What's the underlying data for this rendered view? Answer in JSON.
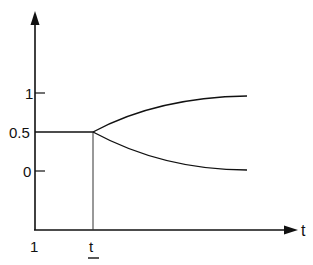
{
  "diagram": {
    "type": "line",
    "x_axis": {
      "label": "t",
      "tick_labels": [
        "1",
        "t"
      ],
      "marked_tick": "t"
    },
    "y_axis": {
      "tick_labels": [
        "1",
        "0.5",
        "0"
      ]
    },
    "series": [
      {
        "name": "constant-segment",
        "description": "horizontal at 0.5 from 1 to t"
      },
      {
        "name": "upper-branch",
        "description": "rises from 0.5 at t toward 1"
      },
      {
        "name": "lower-branch",
        "description": "falls from 0.5 at t toward 0"
      }
    ]
  },
  "labels": {
    "x_axis": "t",
    "y_tick_1": "1",
    "y_tick_05": "0.5",
    "y_tick_0": "0",
    "x_tick_1": "1",
    "x_tick_t": "t"
  },
  "colors": {
    "line": "#111111",
    "background": "#ffffff"
  }
}
